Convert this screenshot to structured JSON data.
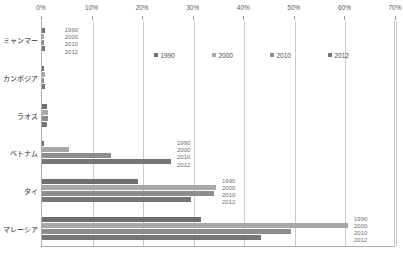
{
  "chart_data": {
    "type": "bar",
    "orientation": "horizontal",
    "title": "",
    "subtitle": "",
    "xlabel": "",
    "ylabel": "",
    "xlim": [
      0,
      70
    ],
    "xtick_labels": [
      "0%",
      "10%",
      "20%",
      "30%",
      "40%",
      "50%",
      "60%",
      "70%"
    ],
    "xticks": [
      0,
      10,
      20,
      30,
      40,
      50,
      60,
      70
    ],
    "grid": true,
    "legend_position": "top-inside",
    "categories": [
      "ミャンマー",
      "カンボジア",
      "ラオス",
      "ベトナム",
      "タイ",
      "マレーシア"
    ],
    "series": [
      {
        "name": "1990",
        "color": "#6f6f6f",
        "values": [
          0.5,
          0.4,
          1.0,
          0.3,
          19.0,
          31.5
        ]
      },
      {
        "name": "2000",
        "color": "#a8a8a8",
        "values": [
          0.3,
          0.5,
          1.2,
          5.3,
          34.4,
          60.5
        ]
      },
      {
        "name": "2010",
        "color": "#8d8d8d",
        "values": [
          0.4,
          0.4,
          1.1,
          13.6,
          34.0,
          49.2
        ]
      },
      {
        "name": "2012",
        "color": "#767676",
        "values": [
          0.6,
          0.6,
          0.9,
          25.5,
          29.4,
          43.3
        ]
      }
    ],
    "annotations": [
      {
        "text": [
          "1990",
          "2000",
          "2010",
          "2012"
        ],
        "category": "ミャンマー"
      },
      {
        "text": [
          "1990",
          "2000",
          "2010",
          "2012"
        ],
        "category": "ベトナム"
      },
      {
        "text": [
          "1990",
          "2000",
          "2010",
          "2012"
        ],
        "category": "タイ"
      },
      {
        "text": [
          "1990",
          "2000",
          "2010",
          "2012"
        ],
        "category": "マレーシア"
      }
    ]
  },
  "legend": {
    "items": [
      {
        "label": "1990",
        "color": "#6f6f6f"
      },
      {
        "label": "2000",
        "color": "#a8a8a8"
      },
      {
        "label": "2010",
        "color": "#8d8d8d"
      },
      {
        "label": "2012",
        "color": "#767676"
      }
    ]
  },
  "axis": {
    "ticks": [
      {
        "label": "0%"
      },
      {
        "label": "10%"
      },
      {
        "label": "20%"
      },
      {
        "label": "30%"
      },
      {
        "label": "40%"
      },
      {
        "label": "50%"
      },
      {
        "label": "60%"
      },
      {
        "label": "70%"
      }
    ]
  },
  "categories": [
    {
      "label": "ミャンマー"
    },
    {
      "label": "カンボジア"
    },
    {
      "label": "ラオス"
    },
    {
      "label": "ベトナム"
    },
    {
      "label": "タイ"
    },
    {
      "label": "マレーシア"
    }
  ],
  "annotation_years": [
    "1990",
    "2000",
    "2010",
    "2012"
  ]
}
